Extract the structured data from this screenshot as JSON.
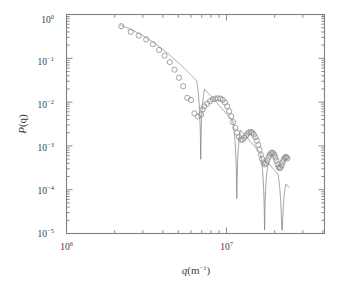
{
  "figure": {
    "name": "form-factor-loglog-plot",
    "background_color": "#ffffff",
    "frame_color": "#808080",
    "data_color": "#8a8a8a",
    "line_color": "#8a8a8a",
    "text_color": "#3d3d3d"
  },
  "labels": {
    "y_axis_base": "P",
    "y_axis_arg": "(q)",
    "x_axis_var": "q",
    "x_axis_unit_open": "(m",
    "x_axis_unit_exp": "−1",
    "x_axis_unit_close": ")",
    "y_ticks": [
      {
        "mantissa": "10",
        "exponent": "0"
      },
      {
        "mantissa": "10",
        "exponent": "−1"
      },
      {
        "mantissa": "10",
        "exponent": "−2"
      },
      {
        "mantissa": "10",
        "exponent": "−3"
      },
      {
        "mantissa": "10",
        "exponent": "−4"
      },
      {
        "mantissa": "10",
        "exponent": "−5"
      }
    ],
    "x_ticks": [
      {
        "mantissa": "10",
        "exponent": "6"
      },
      {
        "mantissa": "10",
        "exponent": "7"
      }
    ]
  },
  "chart_data": {
    "type": "scatter",
    "title": "",
    "xlabel": "q(m−1)",
    "ylabel": "P(q)",
    "xscale": "log",
    "yscale": "log",
    "xlim": [
      1000000,
      40000000
    ],
    "ylim": [
      1e-05,
      2
    ],
    "grid": false,
    "legend": "none",
    "xtick_values": [
      1000000,
      10000000
    ],
    "ytick_values": [
      1,
      0.1,
      0.01,
      0.001,
      0.0001,
      1e-05
    ],
    "series": [
      {
        "name": "measured data",
        "style": "open-circles",
        "marker": "o",
        "marker_facecolor": "none",
        "marker_edgecolor": "#8a8a8a",
        "x": [
          2200000,
          2520000,
          2830000,
          3150000,
          3470000,
          3790000,
          4100000,
          4420000,
          4730000,
          5050000,
          5360000,
          5680000,
          6000000,
          6310000,
          6630000,
          6940000,
          7100000,
          7260000,
          7570000,
          7890000,
          8200000,
          8520000,
          8830000,
          9150000,
          9470000,
          9780000,
          10100000,
          10400000,
          10700000,
          11000000,
          11350000,
          11650000,
          11980000,
          12300000,
          12600000,
          12900000,
          13250000,
          13550000,
          13880000,
          14200000,
          14500000,
          14800000,
          15150000,
          15450000,
          15800000,
          16100000,
          16400000,
          16700000,
          17050000,
          17350000,
          17700000,
          18000000,
          18300000,
          18600000,
          18950000,
          19250000,
          19600000,
          19900000,
          20200000,
          20500000,
          20850000,
          21150000,
          21500000,
          21800000,
          22100000,
          22400000,
          22750000,
          23050000,
          23400000,
          23700000,
          24000000
        ],
        "y": [
          0.54,
          0.4,
          0.33,
          0.27,
          0.21,
          0.155,
          0.115,
          0.082,
          0.055,
          0.036,
          0.023,
          0.0125,
          0.0112,
          0.0055,
          0.0047,
          0.0052,
          0.0068,
          0.008,
          0.0092,
          0.0105,
          0.0115,
          0.012,
          0.0122,
          0.012,
          0.0112,
          0.0098,
          0.008,
          0.0062,
          0.0047,
          0.0035,
          0.0026,
          0.002,
          0.0016,
          0.0014,
          0.00138,
          0.00152,
          0.00172,
          0.00192,
          0.00205,
          0.00208,
          0.002,
          0.00182,
          0.00158,
          0.00132,
          0.00105,
          0.00082,
          0.00063,
          0.0005,
          0.00042,
          0.00038,
          0.0004,
          0.00046,
          0.00054,
          0.00062,
          0.00068,
          0.0007,
          0.00068,
          0.00062,
          0.00054,
          0.00046,
          0.00038,
          0.00033,
          0.00031,
          0.00032,
          0.00036,
          0.00042,
          0.00048,
          0.00053,
          0.00056,
          0.00055,
          0.00052
        ]
      },
      {
        "name": "model fit",
        "style": "solid-line",
        "linewidth": 0.8,
        "color": "#8a8a8a",
        "description": "smooth damped-oscillation form factor with sharp minima at q ≈ 6.9e6, 1.16e7, 1.73e7, 2.22e7 and broad maxima at q ≈ 8.8e6, 1.42e7, 1.95e7, 2.33e7"
      }
    ]
  }
}
